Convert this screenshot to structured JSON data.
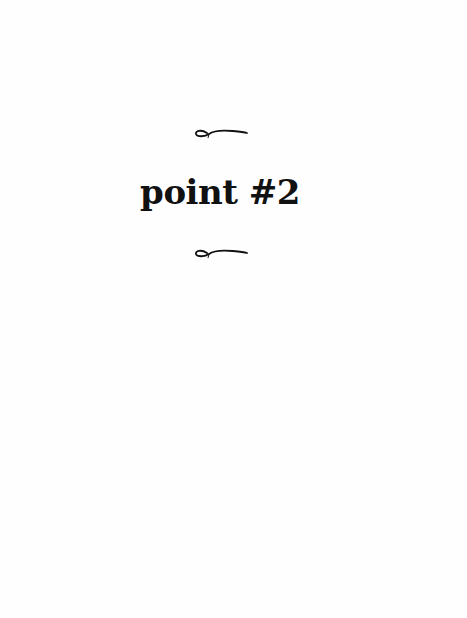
{
  "page": {
    "title": "point #2",
    "ornament_top": "flourish-ornament",
    "ornament_bottom": "flourish-ornament",
    "colors": {
      "text": "#111111",
      "background": "#fefefe"
    }
  }
}
